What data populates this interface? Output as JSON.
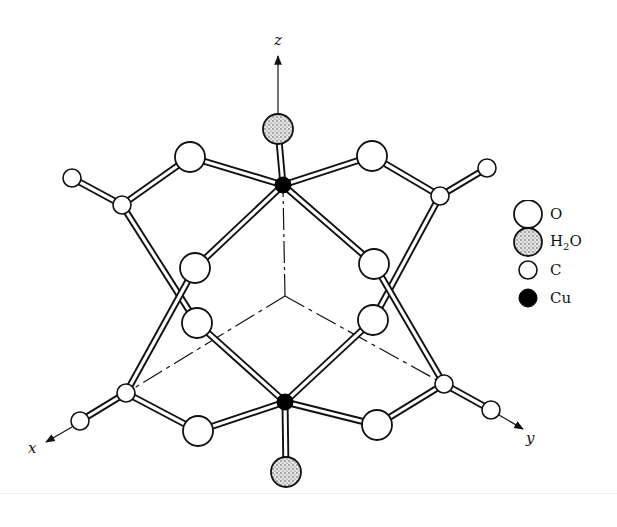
{
  "figure": {
    "type": "molecular structure diagram",
    "axes": {
      "x_label": "x",
      "y_label": "y",
      "z_label": "z",
      "origin": [
        285,
        296
      ]
    },
    "colors": {
      "stroke": "#111111",
      "background": "#ffffff",
      "cu_fill": "#000000",
      "h2o_fill": "#c8c8c8"
    }
  },
  "legend": {
    "items": [
      {
        "symbol": "O",
        "label": "O",
        "style": "large-open-circle"
      },
      {
        "symbol": "H2O",
        "label": "H",
        "sub": "2",
        "label_suffix": "O",
        "style": "large-stippled-circle"
      },
      {
        "symbol": "C",
        "label": "C",
        "style": "small-open-circle"
      },
      {
        "symbol": "Cu",
        "label": "Cu",
        "style": "small-filled-circle"
      }
    ]
  },
  "atoms": {
    "cu": [
      {
        "id": "cu_top",
        "x": 283,
        "y": 185
      },
      {
        "id": "cu_bottom",
        "x": 285,
        "y": 402
      }
    ],
    "h2o": [
      {
        "id": "h2o_top",
        "x": 278,
        "y": 129
      },
      {
        "id": "h2o_bottom",
        "x": 286,
        "y": 472
      }
    ],
    "o": [
      {
        "id": "o_ul",
        "x": 190,
        "y": 157
      },
      {
        "id": "o_ur",
        "x": 372,
        "y": 156
      },
      {
        "id": "o_ml1",
        "x": 195,
        "y": 268
      },
      {
        "id": "o_mr1",
        "x": 374,
        "y": 264
      },
      {
        "id": "o_ml2",
        "x": 197,
        "y": 323
      },
      {
        "id": "o_mr2",
        "x": 373,
        "y": 320
      },
      {
        "id": "o_ll",
        "x": 198,
        "y": 431
      },
      {
        "id": "o_lr",
        "x": 377,
        "y": 425
      }
    ],
    "c": [
      {
        "id": "c_ul",
        "x": 122,
        "y": 205
      },
      {
        "id": "c_ur",
        "x": 440,
        "y": 196
      },
      {
        "id": "c_ll",
        "x": 126,
        "y": 393
      },
      {
        "id": "c_lr",
        "x": 444,
        "y": 384
      },
      {
        "id": "me_ul",
        "x": 72,
        "y": 178
      },
      {
        "id": "me_ur",
        "x": 487,
        "y": 168
      },
      {
        "id": "me_ll",
        "x": 80,
        "y": 421
      },
      {
        "id": "me_lr",
        "x": 491,
        "y": 410
      }
    ]
  }
}
